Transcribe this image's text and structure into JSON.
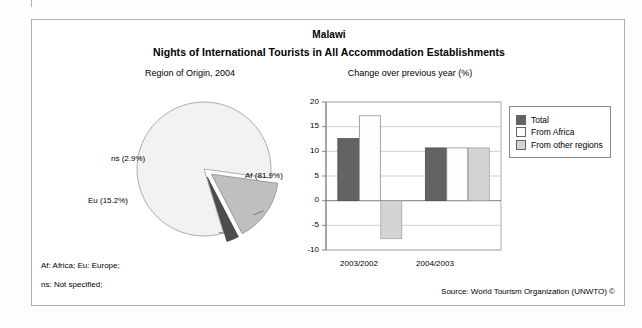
{
  "header": {
    "country": "Malawi",
    "title": "Nights of International Tourists in All Accommodation Establishments"
  },
  "panels": {
    "left_title": "Region of Origin, 2004",
    "right_title": "Change over previous year (%)"
  },
  "footer": {
    "note_abbrev": "Af: Africa; Eu: Europe;",
    "note_ns": "ns: Not specified;",
    "source": "Source: World Tourism Organization (UNWTO) ©"
  },
  "colors": {
    "slice_af": "#f2f2f2",
    "slice_eu": "#bfbfbf",
    "slice_ns": "#4d4d4d",
    "bar_total": "#636363",
    "bar_africa": "#fafafa",
    "bar_other": "#d4d4d4",
    "axis": "#808080",
    "frame": "#aeaeae"
  },
  "chart_data": [
    {
      "type": "pie",
      "title": "Region of Origin, 2004",
      "categories": [
        "Af",
        "Eu",
        "ns"
      ],
      "labels": [
        "Af (81.9%)",
        "Eu (15.2%)",
        "ns (2.9%)"
      ],
      "values": [
        81.9,
        15.2,
        2.9
      ],
      "unit": "%",
      "exploded": [
        "Eu",
        "ns"
      ],
      "legend": "none"
    },
    {
      "type": "bar",
      "title": "Change over previous year (%)",
      "xlabel": "",
      "ylabel": "",
      "ylim": [
        -10,
        20
      ],
      "yticks": [
        20,
        15,
        10,
        5,
        0,
        -5,
        -10
      ],
      "ytick_labels": [
        "20",
        "15",
        "10",
        "5",
        "0",
        "-5",
        "-10"
      ],
      "grid": true,
      "legend_position": "right",
      "categories": [
        "2003/2002",
        "2004/2003"
      ],
      "series": [
        {
          "name": "Total",
          "values": [
            12.6,
            10.7
          ]
        },
        {
          "name": "From Africa",
          "values": [
            17.2,
            10.7
          ]
        },
        {
          "name": "From other regions",
          "values": [
            -7.7,
            10.7
          ]
        }
      ]
    }
  ]
}
